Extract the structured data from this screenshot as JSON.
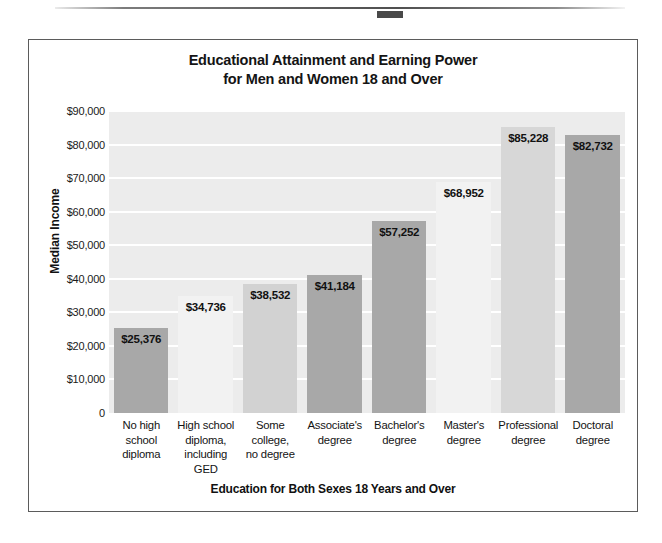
{
  "figure": {
    "title_line1": "Educational Attainment and Earning Power",
    "title_line2": "for Men and Women 18 and Over"
  },
  "chart_data": {
    "type": "bar",
    "title": "Educational Attainment and Earning Power for Men and Women 18 and Over",
    "xlabel": "Education for Both Sexes 18 Years and Over",
    "ylabel": "Median Income",
    "ylim": [
      0,
      90000
    ],
    "ytick_labels": [
      "$90,000",
      "$80,000",
      "$70,000",
      "$60,000",
      "$50,000",
      "$40,000",
      "$30,000",
      "$20,000",
      "$10,000",
      "0"
    ],
    "ytick_values": [
      90000,
      80000,
      70000,
      60000,
      50000,
      40000,
      30000,
      20000,
      10000,
      0
    ],
    "grid": true,
    "legend": "none",
    "categories": [
      "No high school diploma",
      "High school diploma, including GED",
      "Some college, no degree",
      "Associate's degree",
      "Bachelor's degree",
      "Master's degree",
      "Professional degree",
      "Doctoral degree"
    ],
    "category_label_lines": [
      [
        "No high",
        "school",
        "diploma"
      ],
      [
        "High school",
        "diploma,",
        "including",
        "GED"
      ],
      [
        "Some",
        "college,",
        "no degree"
      ],
      [
        "Associate's",
        "degree"
      ],
      [
        "Bachelor's",
        "degree"
      ],
      [
        "Master's",
        "degree"
      ],
      [
        "Professional",
        "degree"
      ],
      [
        "Doctoral",
        "degree"
      ]
    ],
    "values": [
      25376,
      34736,
      38532,
      41184,
      57252,
      68952,
      85228,
      82732
    ],
    "data_labels": [
      "$25,376",
      "$34,736",
      "$38,532",
      "$41,184",
      "$57,252",
      "$68,952",
      "$85,228",
      "$82,732"
    ],
    "bar_colors": [
      "#a8a8a8",
      "#f2f2f2",
      "#d2d2d2",
      "#a8a8a8",
      "#a8a8a8",
      "#f2f2f2",
      "#d7d7d7",
      "#a8a8a8"
    ]
  },
  "style": {
    "plot_background": "#ececec",
    "gridline_color": "#ffffff",
    "frame_border": "#5b5b5b",
    "text_color": "#141414"
  }
}
